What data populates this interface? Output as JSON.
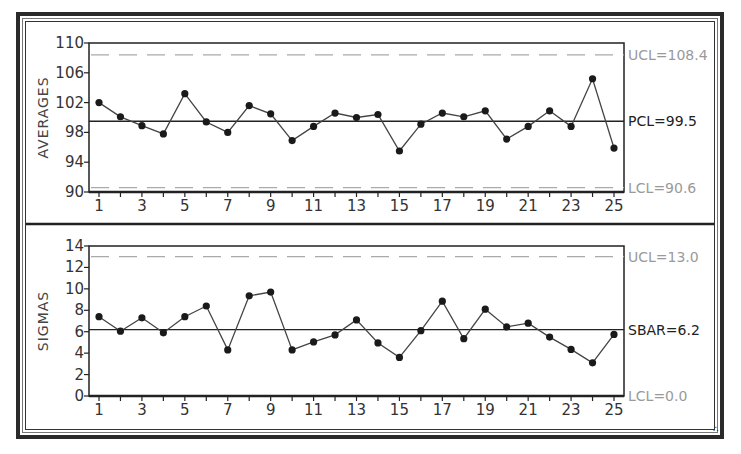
{
  "chart_data": [
    {
      "type": "line",
      "title": "",
      "ylabel": "AVERAGES",
      "xlabel": "",
      "ylim": [
        90,
        110
      ],
      "yticks": [
        90,
        94,
        98,
        102,
        106,
        110
      ],
      "xticks_labeled": [
        1,
        3,
        5,
        7,
        9,
        11,
        13,
        15,
        17,
        19,
        21,
        23,
        25
      ],
      "x": [
        1,
        2,
        3,
        4,
        5,
        6,
        7,
        8,
        9,
        10,
        11,
        12,
        13,
        14,
        15,
        16,
        17,
        18,
        19,
        20,
        21,
        22,
        23,
        24,
        25
      ],
      "values": [
        102.0,
        100.1,
        98.9,
        97.8,
        103.2,
        99.4,
        98.0,
        101.6,
        100.5,
        96.9,
        98.8,
        100.6,
        100.0,
        100.4,
        95.5,
        99.1,
        100.6,
        100.1,
        100.9,
        97.1,
        98.8,
        100.9,
        98.8,
        105.2,
        95.9
      ],
      "control_lines": {
        "ucl": {
          "value": 108.4,
          "label": "UCL=108.4",
          "style": "dashed"
        },
        "center": {
          "value": 99.5,
          "label": "PCL=99.5",
          "style": "solid"
        },
        "lcl": {
          "value": 90.6,
          "label": "LCL=90.6",
          "style": "dashed"
        }
      },
      "grid": false
    },
    {
      "type": "line",
      "title": "",
      "ylabel": "SIGMAS",
      "xlabel": "",
      "ylim": [
        0,
        14
      ],
      "yticks": [
        0,
        2,
        4,
        6,
        8,
        10,
        12,
        14
      ],
      "xticks_labeled": [
        1,
        3,
        5,
        7,
        9,
        11,
        13,
        15,
        17,
        19,
        21,
        23,
        25
      ],
      "x": [
        1,
        2,
        3,
        4,
        5,
        6,
        7,
        8,
        9,
        10,
        11,
        12,
        13,
        14,
        15,
        16,
        17,
        18,
        19,
        20,
        21,
        22,
        23,
        24,
        25
      ],
      "values": [
        7.4,
        6.05,
        7.3,
        5.9,
        7.4,
        8.4,
        4.3,
        9.35,
        9.7,
        4.3,
        5.05,
        5.7,
        7.1,
        4.95,
        3.6,
        6.1,
        8.85,
        5.35,
        8.1,
        6.45,
        6.8,
        5.5,
        4.35,
        3.1,
        5.75
      ],
      "control_lines": {
        "ucl": {
          "value": 13.0,
          "label": "UCL=13.0",
          "style": "dashed"
        },
        "center": {
          "value": 6.2,
          "label": "SBAR=6.2",
          "style": "solid"
        },
        "lcl": {
          "value": 0.0,
          "label": "LCL=0.0",
          "style": "dashed"
        }
      },
      "grid": false
    }
  ],
  "colors": {
    "line": "#444444",
    "marker": "#1a1a1a",
    "center_line": "#222222",
    "limit_line": "#aaaaaa",
    "limit_label": "#9a9a9a",
    "center_label": "#222222",
    "axis": "#222222"
  },
  "corner_glyph": "∴"
}
